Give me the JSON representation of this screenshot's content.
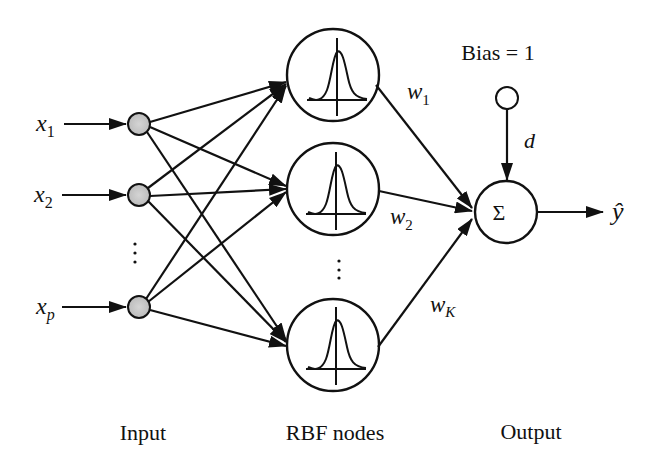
{
  "diagram": {
    "type": "RBF neural network",
    "layers": [
      {
        "name": "Input",
        "label": "Input"
      },
      {
        "name": "RBF nodes",
        "label": "RBF nodes"
      },
      {
        "name": "Output",
        "label": "Output"
      }
    ],
    "inputs": [
      {
        "var": "x",
        "sub": "1"
      },
      {
        "var": "x",
        "sub": "2"
      },
      {
        "var": "x",
        "sub": "p"
      }
    ],
    "input_ellipsis": "⋮",
    "rbf_ellipsis": "⋮",
    "weights": [
      {
        "var": "w",
        "sub": "1"
      },
      {
        "var": "w",
        "sub": "2"
      },
      {
        "var": "w",
        "sub": "K"
      }
    ],
    "bias": {
      "label": "Bias = 1",
      "weight": "d"
    },
    "sum_symbol": "Σ",
    "output": {
      "symbol": "ŷ"
    },
    "colors": {
      "line": "#111111",
      "input_node_fill": "#c8c8c8",
      "background": "#ffffff"
    }
  }
}
